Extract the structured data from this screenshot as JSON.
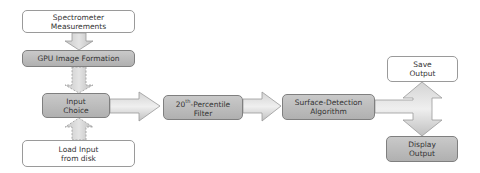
{
  "diagram": {
    "type": "flowchart",
    "nodes": [
      {
        "id": "spectrometer",
        "label": "Spectrometer\nMeasurements",
        "style": "white"
      },
      {
        "id": "gpu",
        "label": "GPU Image Formation",
        "style": "gray"
      },
      {
        "id": "input_choice",
        "label": "Input\nChoice",
        "style": "gray"
      },
      {
        "id": "load_input",
        "label": "Load Input\nfrom disk",
        "style": "white"
      },
      {
        "id": "filter",
        "label": "20th-Percentile\nFilter",
        "style": "gray"
      },
      {
        "id": "surface",
        "label": "Surface-Detection\nAlgorithm",
        "style": "gray"
      },
      {
        "id": "save",
        "label": "Save\nOutput",
        "style": "white"
      },
      {
        "id": "display",
        "label": "Display\nOutput",
        "style": "gray"
      }
    ],
    "edges": [
      {
        "from": "spectrometer",
        "to": "gpu",
        "style": "solid"
      },
      {
        "from": "gpu",
        "to": "input_choice",
        "style": "dashed"
      },
      {
        "from": "load_input",
        "to": "input_choice",
        "style": "dashed"
      },
      {
        "from": "input_choice",
        "to": "filter",
        "style": "solid"
      },
      {
        "from": "filter",
        "to": "surface",
        "style": "solid"
      },
      {
        "from": "surface",
        "to": "save",
        "style": "solid"
      },
      {
        "from": "surface",
        "to": "display",
        "style": "solid"
      }
    ]
  },
  "labels": {
    "spectrometer": "Spectrometer\nMeasurements",
    "gpu": "GPU Image Formation",
    "input_choice": "Input\nChoice",
    "load_input": "Load Input\nfrom disk",
    "filter_main": "20",
    "filter_sup": "th",
    "filter_rest": "-Percentile\nFilter",
    "surface": "Surface-Detection\nAlgorithm",
    "save": "Save\nOutput",
    "display": "Display\nOutput"
  }
}
